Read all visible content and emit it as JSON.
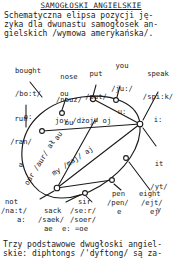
{
  "title": "SAMOGŁOSKI ANGIELSKIE",
  "intro": [
    "Schematyczna elipsa pozycji ję-",
    "zyka dla dwunastu samogłosek an-",
    "gielskich /wymowa amerykańska/."
  ],
  "outro": [
    "Trzy podstawowe dwugłoski angiel-",
    "skie: diphtongs /'dyftong/ są za-"
  ],
  "diagram": {
    "name": "vowel-ellipse",
    "vowels": [
      {
        "id": "bought",
        "word": "bought",
        "transcription": "/bo:t/",
        "symbol": "o:"
      },
      {
        "id": "nose",
        "word": "nose",
        "transcription": "/nouz/",
        "symbol": "ou"
      },
      {
        "id": "put",
        "word": "put",
        "transcription": "/put/",
        "symbol": "u"
      },
      {
        "id": "you",
        "word": "you",
        "transcription": "/ju:/",
        "symbol": "u:"
      },
      {
        "id": "speak",
        "word": "speak",
        "transcription": "/spi:k/",
        "symbol": "i:"
      },
      {
        "id": "run",
        "word": "run",
        "transcription": "/ran/",
        "symbol": "a"
      },
      {
        "id": "it",
        "word": "it",
        "transcription": "/yt/",
        "symbol": "y"
      },
      {
        "id": "not",
        "word": "not",
        "transcription": "/na:t/",
        "symbol": "a:"
      },
      {
        "id": "sack",
        "word": "sack",
        "transcription": "/saek/",
        "symbol": "ae"
      },
      {
        "id": "sir",
        "word": "sir",
        "transcription": "/se:r/",
        "transcription2": "/soer/",
        "symbol": "e: =oe"
      },
      {
        "id": "pen",
        "word": "pen",
        "transcription": "/pen/",
        "symbol": "e"
      },
      {
        "id": "eight",
        "word": "eight",
        "transcription": "/ejt/",
        "symbol": "ej"
      }
    ],
    "diphthongs": [
      {
        "id": "joy",
        "text": "joy /dżoj/ oj"
      },
      {
        "id": "my",
        "text": "my /maj/ aj"
      },
      {
        "id": "our",
        "text": "our /aur/ ał"
      },
      {
        "id": "au",
        "text": "au"
      },
      {
        "id": "ou",
        "text": "ou"
      }
    ],
    "ink_color": "#1a1a1a"
  }
}
